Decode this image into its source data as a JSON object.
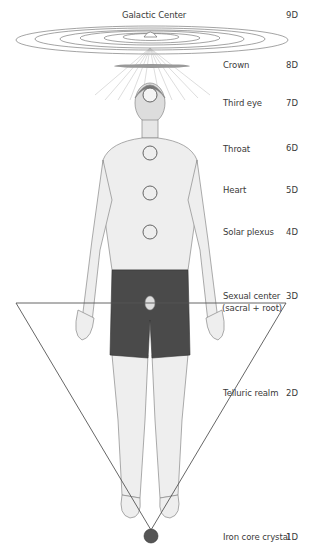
{
  "title": "Galactic Center",
  "levels": [
    {
      "label": "Galactic Center",
      "dimension": "9D"
    },
    {
      "label": "Crown",
      "dimension": "8D"
    },
    {
      "label": "Third eye",
      "dimension": "7D"
    },
    {
      "label": "Throat",
      "dimension": "6D"
    },
    {
      "label": "Heart",
      "dimension": "5D"
    },
    {
      "label": "Solar plexus",
      "dimension": "4D"
    },
    {
      "label": "Sexual center",
      "sublabel": "(sacral + root)",
      "dimension": "3D"
    },
    {
      "label": "Telluric realm",
      "dimension": "2D"
    },
    {
      "label": "Iron core crystal",
      "dimension": "1D"
    }
  ],
  "colors": {
    "ink": "#3a3a3a",
    "shorts": "#4a4a4a",
    "triangle": "#555555"
  }
}
